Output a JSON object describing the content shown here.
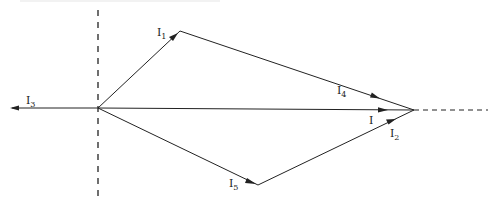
{
  "diagram": {
    "type": "phasor-diagram",
    "stroke_color": "#222222",
    "background": "#ffffff",
    "axis": {
      "vertical_reference": {
        "style": "dashed",
        "x": 98,
        "y_from": 10,
        "y_to": 196
      },
      "horizontal_extension": {
        "style": "dashed",
        "from": [
          414,
          110
        ],
        "to": [
          488,
          110
        ]
      }
    },
    "origin": [
      98,
      108
    ],
    "tip": [
      414,
      110
    ],
    "vectors": [
      {
        "id": "I1",
        "label_main": "I",
        "label_sub": "1",
        "from": [
          98,
          108
        ],
        "to": [
          180,
          31
        ]
      },
      {
        "id": "I4",
        "label_main": "I",
        "label_sub": "4",
        "from": [
          180,
          31
        ],
        "to": [
          414,
          110
        ]
      },
      {
        "id": "I",
        "label_main": "I",
        "label_sub": "",
        "from": [
          98,
          108
        ],
        "to": [
          414,
          110
        ]
      },
      {
        "id": "I5",
        "label_main": "I",
        "label_sub": "5",
        "from": [
          98,
          108
        ],
        "to": [
          258,
          185
        ]
      },
      {
        "id": "I2",
        "label_main": "I",
        "label_sub": "2",
        "from": [
          258,
          185
        ],
        "to": [
          414,
          110
        ]
      },
      {
        "id": "I3",
        "label_main": "I",
        "label_sub": "3",
        "from": [
          98,
          108
        ],
        "to": [
          10,
          108
        ]
      }
    ]
  }
}
